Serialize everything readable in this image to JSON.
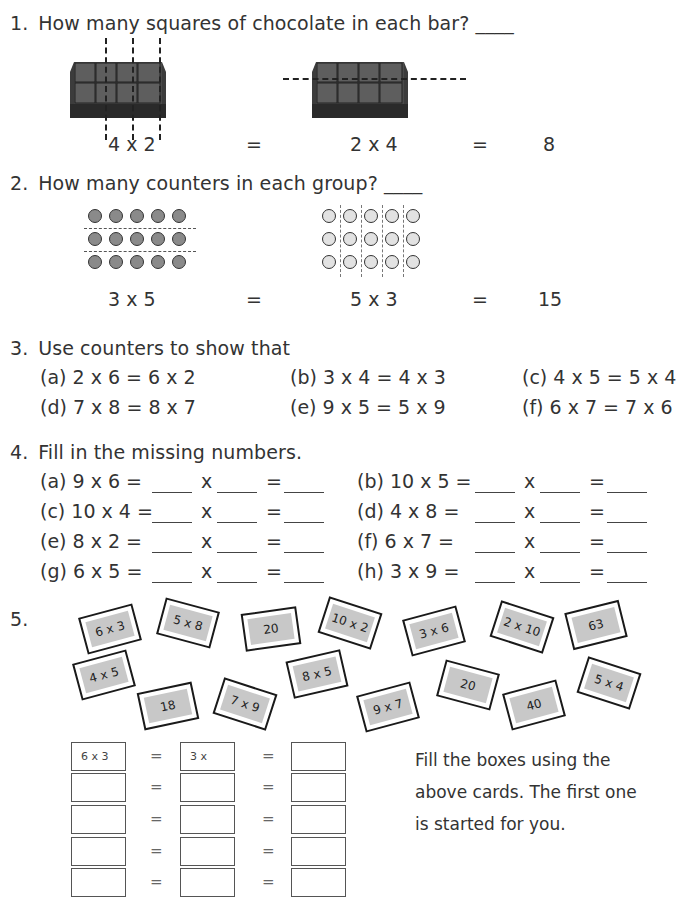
{
  "q1": {
    "number": "1.",
    "text": "How many squares of chocolate in each bar? ____",
    "left_expr": "4 x 2",
    "eq1": "=",
    "mid_expr": "2 x 4",
    "eq2": "=",
    "answer": "8"
  },
  "q2": {
    "number": "2.",
    "text": "How many counters in each group? ____",
    "left_expr": "3 x 5",
    "eq1": "=",
    "mid_expr": "5 x 3",
    "eq2": "=",
    "answer": "15"
  },
  "q3": {
    "number": "3.",
    "text": "Use counters to show that",
    "items": [
      {
        "label": "(a) 2 x 6 = 6 x 2"
      },
      {
        "label": "(b) 3 x 4 = 4 x 3"
      },
      {
        "label": "(c) 4 x 5 = 5 x 4"
      },
      {
        "label": "(d) 7 x 8 = 8 x 7"
      },
      {
        "label": "(e) 9 x 5 = 5 x 9"
      },
      {
        "label": "(f) 6 x 7 = 7 x 6"
      }
    ]
  },
  "q4": {
    "number": "4.",
    "text": "Fill in the missing numbers.",
    "times": "x",
    "equals": "=",
    "items": [
      {
        "label": "(a) 9 x 6  ="
      },
      {
        "label": "(b) 10 x 5 ="
      },
      {
        "label": "(c) 10 x 4 ="
      },
      {
        "label": "(d) 4 x 8 ="
      },
      {
        "label": "(e) 8 x 2 ="
      },
      {
        "label": "(f)  6 x 7 ="
      },
      {
        "label": "(g) 6 x 5 ="
      },
      {
        "label": "(h) 3 x 9 ="
      }
    ]
  },
  "q5": {
    "number": "5.",
    "cards": [
      {
        "text": "6 x 3"
      },
      {
        "text": "5 x 8"
      },
      {
        "text": "20"
      },
      {
        "text": "10 x 2"
      },
      {
        "text": "3 x 6"
      },
      {
        "text": "2 x 10"
      },
      {
        "text": "63"
      },
      {
        "text": "4 x 5"
      },
      {
        "text": "18"
      },
      {
        "text": "7 x 9"
      },
      {
        "text": "8 x 5"
      },
      {
        "text": "9 x 7"
      },
      {
        "text": "20"
      },
      {
        "text": "40"
      },
      {
        "text": "5 x 4"
      }
    ],
    "grid_equals": "=",
    "first_row": {
      "col1": "6 x 3",
      "col2": "3 x",
      "col3": ""
    },
    "instructions": [
      "Fill the boxes using the",
      "above cards. The first one",
      "is started for you."
    ]
  }
}
